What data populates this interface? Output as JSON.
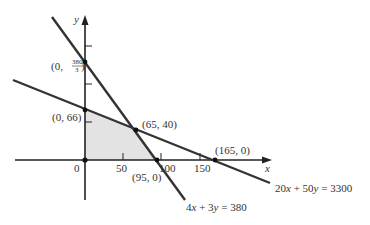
{
  "diagram": {
    "type": "linear-programming-feasible-region",
    "axes": {
      "x_label": "x",
      "y_label": "y",
      "origin_label": "0",
      "x_ticks": [
        "50",
        "100",
        "150"
      ]
    },
    "lines": [
      {
        "equation": "4x + 3y = 380",
        "label_parts": [
          "4",
          "x",
          " + 3",
          "y",
          " = 380"
        ]
      },
      {
        "equation": "20x + 50y = 3300",
        "label_parts": [
          "20",
          "x",
          " + 50",
          "y",
          " = 3300"
        ]
      }
    ],
    "points": [
      {
        "label": "(0, 380/3)",
        "prefix": "(0, ",
        "num": "380",
        "den": "3",
        "suffix": ")"
      },
      {
        "label": "(0, 66)"
      },
      {
        "label": "(65, 40)"
      },
      {
        "label": "(95, 0)"
      },
      {
        "label": "(165, 0)"
      }
    ],
    "colors": {
      "line": "#333333",
      "region_fill": "#e3e3e3",
      "axis": "#222222"
    }
  }
}
